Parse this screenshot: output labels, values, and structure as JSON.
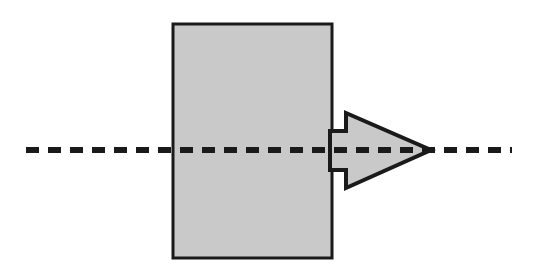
{
  "figure": {
    "title": "Rectangular block with rightward arrow on dashed centerline",
    "canvas": {
      "width": 533,
      "height": 276,
      "background": "#ffffff"
    },
    "shapes": {
      "rectangle": {
        "label": "block",
        "x": 173,
        "y": 24,
        "width": 159,
        "height": 234,
        "fill": "#c9c9c9",
        "stroke": "#1a1a1a",
        "stroke_width": 3
      },
      "arrow": {
        "label": "force-arrow",
        "direction": "right",
        "fill": "#c9c9c9",
        "stroke": "#1a1a1a",
        "stroke_width": 4,
        "shaft_start_x": 330,
        "shaft_top_y": 131,
        "shaft_bottom_y": 170,
        "barb_x": 346,
        "barb_top_y": 113,
        "barb_bottom_y": 188,
        "tip_x": 431,
        "tip_y": 150,
        "points": "330,131 346,131 346,113 431,150 346,188 346,170 330,170"
      },
      "dashed_line": {
        "label": "centerline",
        "x1": 26,
        "x2": 512,
        "y": 150,
        "stroke": "#1a1a1a",
        "stroke_width": 6,
        "dash": 13,
        "gap": 9
      }
    }
  }
}
